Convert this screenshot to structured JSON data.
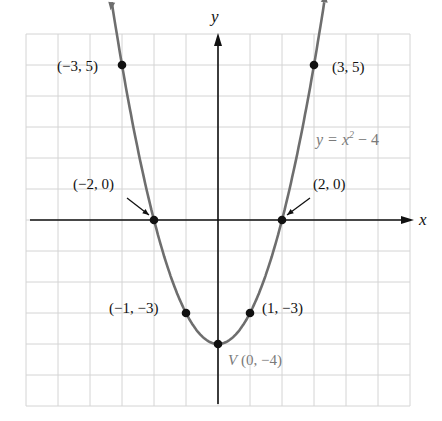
{
  "chart_data": {
    "type": "line",
    "title": "",
    "xlabel": "x",
    "ylabel": "y",
    "xlim": [
      -6,
      6
    ],
    "ylim": [
      -6,
      6
    ],
    "grid": true,
    "legend": null,
    "series": [
      {
        "name": "y = x^2 - 4",
        "function": "x^2 - 4",
        "x": [
          -3,
          -2,
          -1,
          0,
          1,
          2,
          3
        ],
        "values": [
          5,
          0,
          -3,
          -4,
          -3,
          0,
          5
        ]
      }
    ],
    "points": [
      {
        "label": "(−3, 5)",
        "x": -3,
        "y": 5
      },
      {
        "label": "(3, 5)",
        "x": 3,
        "y": 5
      },
      {
        "label": "(−2, 0)",
        "x": -2,
        "y": 0,
        "arrow": true
      },
      {
        "label": "(2, 0)",
        "x": 2,
        "y": 0,
        "arrow": true
      },
      {
        "label": "(−1, −3)",
        "x": -1,
        "y": -3
      },
      {
        "label": "(1, −3)",
        "x": 1,
        "y": -3
      },
      {
        "label": "V (0, −4)",
        "x": 0,
        "y": -4,
        "vertex": true
      }
    ],
    "annotations": [
      "y = x² − 4",
      "V (0, −4)"
    ],
    "colors": {
      "curve": "#6e6e6e",
      "axes": "#111111",
      "grid": "#d4d4d4",
      "points": "#111111",
      "annotation": "#7a7a7a"
    }
  },
  "labels": {
    "x_axis": "x",
    "y_axis": "y",
    "equation_prefix": "y = x",
    "equation_exp": "2",
    "equation_suffix": " − 4",
    "p_m3_5": "(−3, 5)",
    "p_3_5": "(3, 5)",
    "p_m2_0": "(−2, 0)",
    "p_2_0": "(2, 0)",
    "p_m1_m3": "(−1, −3)",
    "p_1_m3": "(1, −3)",
    "vertex_letter": "V",
    "vertex_coords": "(0, −4)"
  }
}
